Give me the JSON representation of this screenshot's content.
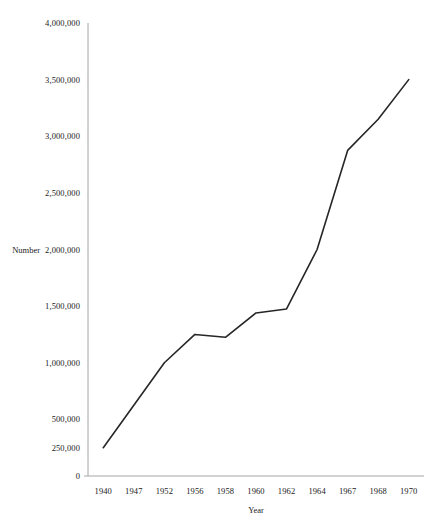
{
  "chart_data": {
    "type": "line",
    "title": "",
    "xlabel": "Year",
    "ylabel": "Number",
    "categories": [
      "1940",
      "1947",
      "1952",
      "1956",
      "1958",
      "1960",
      "1962",
      "1964",
      "1967",
      "1968",
      "1970"
    ],
    "values": [
      250000,
      625000,
      1000000,
      1250000,
      1225000,
      1440000,
      1475000,
      2000000,
      2875000,
      3150000,
      3500000
    ],
    "series": [
      {
        "name": "Number",
        "values": [
          250000,
          625000,
          1000000,
          1250000,
          1225000,
          1440000,
          1475000,
          2000000,
          2875000,
          3150000,
          3500000
        ]
      }
    ],
    "ylim": [
      0,
      4000000
    ],
    "y_ticks": [
      0,
      250000,
      500000,
      1000000,
      1500000,
      2000000,
      2500000,
      3000000,
      3500000,
      4000000
    ],
    "y_tick_labels": [
      "0",
      "250,000",
      "500,000",
      "1,000,000",
      "1,500,000",
      "2,000,000",
      "2,500,000",
      "3,000,000",
      "3,500,000",
      "4,000,000"
    ],
    "grid": false,
    "legend": "none",
    "line_color": "#262626",
    "background_color": "#ffffff",
    "axis_color": "#7f7f7f"
  }
}
